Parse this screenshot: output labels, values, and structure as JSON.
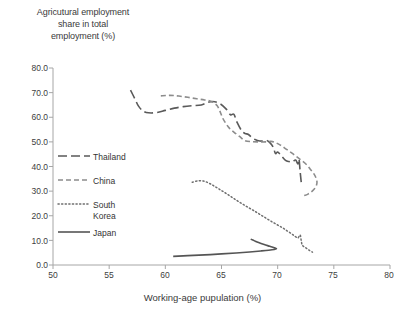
{
  "chart_data": {
    "type": "line",
    "title": "Agricutural employment\nshare in total\nemployment (%)",
    "xlabel": "Working-age pupulation (%)",
    "ylabel": "Agricutural employment share in total employment (%)",
    "xlim": [
      50,
      80
    ],
    "ylim": [
      0,
      80
    ],
    "xticks": [
      "50",
      "55",
      "60",
      "65",
      "70",
      "75",
      "80"
    ],
    "yticks": [
      "0.0",
      "10.0",
      "20.0",
      "30.0",
      "40.0",
      "50.0",
      "60.0",
      "70.0",
      "80.0"
    ],
    "grid": false,
    "legend_position": "inside-left",
    "axis_color": "#a6a6a6",
    "series": [
      {
        "name": "Thailand",
        "color": "#5a5a5a",
        "dash": "long-dash",
        "points": [
          [
            56.9,
            71.0
          ],
          [
            57.3,
            67.4
          ],
          [
            57.6,
            64.6
          ],
          [
            58.0,
            62.6
          ],
          [
            58.5,
            61.8
          ],
          [
            59.2,
            61.9
          ],
          [
            60.0,
            62.8
          ],
          [
            60.8,
            63.7
          ],
          [
            61.6,
            64.3
          ],
          [
            62.4,
            64.7
          ],
          [
            63.2,
            65.0
          ],
          [
            63.9,
            66.2
          ],
          [
            64.4,
            66.3
          ],
          [
            64.9,
            65.4
          ],
          [
            65.4,
            63.4
          ],
          [
            65.8,
            61.0
          ],
          [
            66.1,
            61.2
          ],
          [
            66.4,
            57.8
          ],
          [
            66.8,
            54.5
          ],
          [
            67.1,
            53.4
          ],
          [
            67.4,
            53.0
          ],
          [
            67.8,
            51.4
          ],
          [
            68.2,
            50.6
          ],
          [
            68.6,
            50.3
          ],
          [
            69.0,
            50.6
          ],
          [
            69.3,
            49.7
          ],
          [
            69.6,
            47.9
          ],
          [
            69.8,
            45.3
          ],
          [
            70.0,
            45.9
          ],
          [
            70.3,
            44.5
          ],
          [
            70.7,
            42.5
          ],
          [
            71.0,
            42.0
          ],
          [
            71.3,
            41.9
          ],
          [
            71.6,
            42.6
          ],
          [
            71.8,
            41.0
          ],
          [
            71.9,
            43.0
          ],
          [
            72.0,
            38.0
          ],
          [
            72.1,
            33.5
          ]
        ]
      },
      {
        "name": "China",
        "color": "#8c8c8c",
        "dash": "short-dash",
        "points": [
          [
            59.6,
            68.7
          ],
          [
            60.4,
            68.9
          ],
          [
            61.2,
            68.6
          ],
          [
            62.0,
            68.1
          ],
          [
            62.8,
            67.5
          ],
          [
            63.5,
            67.0
          ],
          [
            64.1,
            66.4
          ],
          [
            64.6,
            64.8
          ],
          [
            64.9,
            62.0
          ],
          [
            65.1,
            59.7
          ],
          [
            65.4,
            57.4
          ],
          [
            65.7,
            55.6
          ],
          [
            66.1,
            54.0
          ],
          [
            66.6,
            52.2
          ],
          [
            67.1,
            50.5
          ],
          [
            67.7,
            50.1
          ],
          [
            68.3,
            50.0
          ],
          [
            68.9,
            50.0
          ],
          [
            69.4,
            50.2
          ],
          [
            69.8,
            49.7
          ],
          [
            70.2,
            48.8
          ],
          [
            70.6,
            47.6
          ],
          [
            71.0,
            46.3
          ],
          [
            71.4,
            45.0
          ],
          [
            71.8,
            43.6
          ],
          [
            72.2,
            42.2
          ],
          [
            72.6,
            40.6
          ],
          [
            72.9,
            38.9
          ],
          [
            73.2,
            37.2
          ],
          [
            73.4,
            35.5
          ],
          [
            73.5,
            33.6
          ],
          [
            73.4,
            31.8
          ],
          [
            73.1,
            30.1
          ],
          [
            72.7,
            28.8
          ],
          [
            72.3,
            28.1
          ]
        ]
      },
      {
        "name": "South Korea",
        "color": "#6e6e6e",
        "dash": "dotted",
        "points": [
          [
            62.4,
            33.6
          ],
          [
            62.9,
            34.2
          ],
          [
            63.4,
            34.1
          ],
          [
            63.9,
            33.2
          ],
          [
            64.4,
            31.9
          ],
          [
            64.9,
            30.5
          ],
          [
            65.4,
            29.1
          ],
          [
            65.9,
            27.6
          ],
          [
            66.4,
            26.1
          ],
          [
            66.9,
            24.7
          ],
          [
            67.4,
            23.3
          ],
          [
            67.9,
            22.0
          ],
          [
            68.4,
            20.6
          ],
          [
            68.9,
            19.2
          ],
          [
            69.4,
            17.8
          ],
          [
            69.9,
            16.5
          ],
          [
            70.4,
            15.2
          ],
          [
            70.8,
            14.0
          ],
          [
            71.2,
            12.8
          ],
          [
            71.5,
            11.8
          ],
          [
            71.8,
            11.0
          ],
          [
            72.0,
            12.2
          ],
          [
            72.1,
            9.9
          ],
          [
            72.2,
            8.0
          ],
          [
            72.5,
            7.0
          ],
          [
            72.8,
            6.0
          ],
          [
            73.1,
            5.2
          ]
        ]
      },
      {
        "name": "Japan",
        "color": "#555555",
        "dash": "solid",
        "points": [
          [
            60.7,
            3.5
          ],
          [
            62.0,
            3.8
          ],
          [
            63.5,
            4.1
          ],
          [
            65.0,
            4.5
          ],
          [
            66.3,
            4.9
          ],
          [
            67.5,
            5.3
          ],
          [
            68.5,
            5.7
          ],
          [
            69.2,
            6.0
          ],
          [
            69.7,
            6.3
          ],
          [
            69.9,
            6.6
          ],
          [
            69.7,
            7.0
          ],
          [
            69.3,
            7.6
          ],
          [
            68.8,
            8.3
          ],
          [
            68.3,
            9.1
          ],
          [
            67.9,
            9.9
          ],
          [
            67.6,
            10.5
          ]
        ]
      }
    ]
  },
  "legend": {
    "items": [
      {
        "label": "Thailand"
      },
      {
        "label": "China"
      },
      {
        "label": "South\nKorea"
      },
      {
        "label": "Japan"
      }
    ]
  }
}
